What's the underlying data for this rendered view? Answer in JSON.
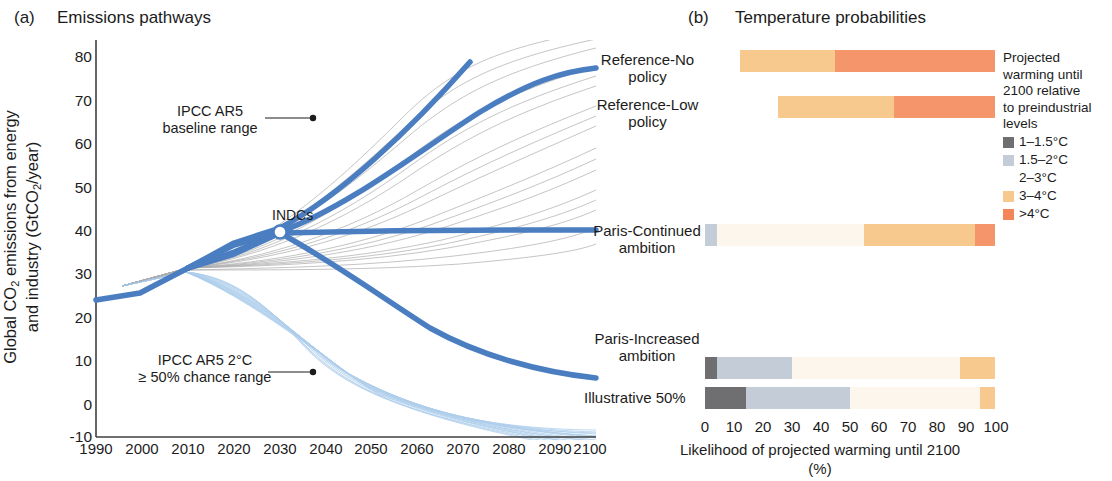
{
  "panel_a": {
    "tag": "(a)",
    "title": "Emissions pathways",
    "ylabel_line1": "Global CO",
    "ylabel_sub": "2",
    "ylabel_line1b": " emissions from energy",
    "ylabel_line2": "and industry (GtCO",
    "ylabel_sub2": "2",
    "ylabel_line2b": "/year)",
    "yticks": [
      "80",
      "70",
      "60",
      "50",
      "40",
      "30",
      "20",
      "10",
      "0",
      "-10"
    ],
    "xticks": [
      "1990",
      "2000",
      "2010",
      "2020",
      "2030",
      "2040",
      "2050",
      "2060",
      "2070",
      "2080",
      "2090",
      "2100"
    ],
    "annotations": {
      "baseline": "IPCC AR5\nbaseline range",
      "two_degree": "IPCC AR5 2°C\n≥ 50% chance range",
      "indcs": "INDCs"
    }
  },
  "panel_b": {
    "tag": "(b)",
    "title": "Temperature probabilities",
    "rows": [
      {
        "label": "Reference-No\npolicy",
        "segments": [
          {
            "cat": "none",
            "pct": 12
          },
          {
            "cat": "c3_4",
            "pct": 33
          },
          {
            "cat": "c4plus",
            "pct": 55
          }
        ]
      },
      {
        "label": "Reference-Low\npolicy",
        "segments": [
          {
            "cat": "none",
            "pct": 25
          },
          {
            "cat": "c3_4",
            "pct": 40
          },
          {
            "cat": "c4plus",
            "pct": 35
          }
        ]
      },
      {
        "label": "Paris-Continued\nambition",
        "segments": [
          {
            "cat": "c1_5_2",
            "pct": 4
          },
          {
            "cat": "c2_3",
            "pct": 51
          },
          {
            "cat": "c3_4",
            "pct": 38
          },
          {
            "cat": "c4plus",
            "pct": 7
          }
        ]
      },
      {
        "label": "Paris-Increased\nambition",
        "segments": [
          {
            "cat": "c1_1_5",
            "pct": 4
          },
          {
            "cat": "c1_5_2",
            "pct": 26
          },
          {
            "cat": "c2_3",
            "pct": 58
          },
          {
            "cat": "c3_4",
            "pct": 12
          }
        ]
      },
      {
        "label": "Illustrative 50%",
        "segments": [
          {
            "cat": "c1_1_5",
            "pct": 14
          },
          {
            "cat": "c1_5_2",
            "pct": 36
          },
          {
            "cat": "c2_3",
            "pct": 45
          },
          {
            "cat": "c3_4",
            "pct": 5
          }
        ]
      }
    ],
    "xticks": [
      "0",
      "10",
      "20",
      "30",
      "40",
      "50",
      "60",
      "70",
      "80",
      "90",
      "100"
    ],
    "xlabel_line1": "Likelihood of projected warming until 2100",
    "xlabel_line2": "(%)"
  },
  "legend": {
    "heading": "Projected warming until 2100 relative to preindustrial levels",
    "heading_lines": [
      "Projected",
      "warming until",
      "2100 relative",
      "to preindustrial",
      "levels"
    ],
    "items": [
      {
        "label": "1–1.5°C",
        "color": "#6f6f72"
      },
      {
        "label": "1.5–2°C",
        "color": "#c4ccd8"
      },
      {
        "label": "2–3°C",
        "color": "#fdf6ec"
      },
      {
        "label": "3–4°C",
        "color": "#f7c98f"
      },
      {
        "label": ">4°C",
        "color": "#f4855b"
      }
    ]
  },
  "colors": {
    "c1_1_5": "#6f6f72",
    "c1_5_2": "#c4ccd8",
    "c2_3": "#fdf6ec",
    "c3_4": "#f7c98f",
    "c4plus": "#f5956c",
    "line_blue": "#4a7ec1",
    "axis": "#3f3f3f"
  },
  "chart_data": [
    {
      "type": "line",
      "title": "Emissions pathways",
      "xlabel": "",
      "ylabel": "Global CO2 emissions from energy and industry (GtCO2/year)",
      "xlim": [
        1990,
        2100
      ],
      "ylim": [
        -10,
        80
      ],
      "grid": false,
      "legend": "none",
      "x": [
        1990,
        2000,
        2010,
        2020,
        2030,
        2040,
        2050,
        2060,
        2070,
        2080,
        2090,
        2100
      ],
      "series": [
        {
          "name": "Reference-No policy",
          "values": [
            22.3,
            25.0,
            32.0,
            39.0,
            45.5,
            52.0,
            58.5,
            65.5,
            72.5,
            80.0,
            null,
            null
          ]
        },
        {
          "name": "Reference-Low policy",
          "values": [
            22.3,
            25.0,
            32.0,
            38.0,
            43.5,
            48.5,
            53.5,
            58.5,
            62.5,
            65.5,
            67.5,
            68.8
          ]
        },
        {
          "name": "Paris-Continued ambition",
          "values": [
            22.3,
            25.0,
            32.0,
            36.5,
            38.6,
            38.8,
            38.9,
            39.0,
            39.1,
            39.2,
            39.3,
            39.3
          ]
        },
        {
          "name": "Paris-Increased ambition",
          "values": [
            22.3,
            25.0,
            32.0,
            36.5,
            38.6,
            34.0,
            28.5,
            22.5,
            17.0,
            12.5,
            9.2,
            7.0
          ]
        }
      ],
      "marker_points": [
        {
          "label": "INDCs",
          "x": 2030,
          "y": 38.6
        }
      ],
      "annotations": [
        {
          "text": "IPCC AR5 baseline range",
          "x": 2020,
          "y": 64
        },
        {
          "text": "IPCC AR5 2°C ≥ 50% chance range",
          "x": 2035,
          "y": 5
        }
      ]
    },
    {
      "type": "bar",
      "orientation": "horizontal",
      "stacked": true,
      "title": "Temperature probabilities",
      "xlabel": "Likelihood of projected warming until 2100 (%)",
      "ylabel": "",
      "xlim": [
        0,
        100
      ],
      "categories": [
        "Reference-No policy",
        "Reference-Low policy",
        "Paris-Continued ambition",
        "Paris-Increased ambition",
        "Illustrative 50%"
      ],
      "series": [
        {
          "name": "1–1.5°C",
          "values": [
            0,
            0,
            0,
            4,
            14
          ]
        },
        {
          "name": "1.5–2°C",
          "values": [
            0,
            0,
            4,
            26,
            36
          ]
        },
        {
          "name": "2–3°C",
          "values": [
            0,
            0,
            51,
            58,
            45
          ]
        },
        {
          "name": "3–4°C",
          "values": [
            33,
            40,
            38,
            12,
            5
          ]
        },
        {
          "name": ">4°C",
          "values": [
            55,
            35,
            7,
            0,
            0
          ]
        }
      ],
      "note": "Bars for Reference-No policy and Reference-Low policy begin at 12% and 25% respectively (remaining probability not shown)"
    }
  ]
}
